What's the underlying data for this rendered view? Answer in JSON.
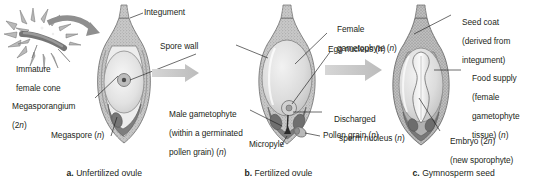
{
  "figure": {
    "background": "#ffffff",
    "ink": "#231f20",
    "arrow_color": "#c9c9c9",
    "tissue_dark": "#8a8a8a",
    "tissue_mid": "#b5b5b5",
    "tissue_light": "#dedede",
    "tissue_pale": "#efefef"
  },
  "panels": [
    {
      "id": "a",
      "caption_letter": "a.",
      "caption_text": "Unfertilized ovule",
      "labels": [
        {
          "name": "immature-female-cone",
          "line1": "Immature",
          "line2": "female cone"
        },
        {
          "name": "megasporangium",
          "line1": "Megasporangium",
          "line2": "(2n)"
        },
        {
          "name": "megaspore",
          "line1": "Megaspore (n)",
          "line2": ""
        },
        {
          "name": "integument",
          "line1": "Integument",
          "line2": ""
        },
        {
          "name": "spore-wall",
          "line1": "Spore wall",
          "line2": ""
        }
      ]
    },
    {
      "id": "b",
      "caption_letter": "b.",
      "caption_text": "Fertilized ovule",
      "labels": [
        {
          "name": "male-gametophyte",
          "line1": "Male gametophyte",
          "line2": "(within a germinated",
          "line3": "pollen grain) (n)"
        },
        {
          "name": "micropyle",
          "line1": "Micropyle",
          "line2": ""
        },
        {
          "name": "female-gametophyte",
          "line1": "Female",
          "line2": "gametophyte (n)"
        },
        {
          "name": "egg-nucleus",
          "line1": "Egg nucleus (n)",
          "line2": ""
        },
        {
          "name": "discharged-sperm-nucleus",
          "line1": "Discharged",
          "line2": "sperm nucleus (n)"
        },
        {
          "name": "pollen-grain",
          "line1": "Pollen grain (n)",
          "line2": ""
        }
      ]
    },
    {
      "id": "c",
      "caption_letter": "c.",
      "caption_text": "Gymnosperm seed",
      "labels": [
        {
          "name": "seed-coat",
          "line1": "Seed coat",
          "line2": "(derived from",
          "line3": "integument)"
        },
        {
          "name": "food-supply",
          "line1": "Food supply",
          "line2": "(female",
          "line3": "gametophyte",
          "line4": "tissue) (n)"
        },
        {
          "name": "embryo",
          "line1": "Embryo (2n)",
          "line2": "(new sporophyte)"
        }
      ]
    }
  ],
  "text": {
    "immature": "Immature",
    "female_cone": "female cone",
    "megasporangium": "Megasporangium",
    "megasporangium_ploidy": "(2n)",
    "megaspore": "Megaspore (n)",
    "integument": "Integument",
    "spore_wall": "Spore wall",
    "male_gametophyte_l1": "Male gametophyte",
    "male_gametophyte_l2": "(within a germinated",
    "male_gametophyte_l3": "pollen grain) (n)",
    "micropyle": "Micropyle",
    "female_l1": "Female",
    "female_l2": "gametophyte (n)",
    "egg_nucleus": "Egg nucleus (n)",
    "discharged_l1": "Discharged",
    "discharged_l2": "sperm nucleus (n)",
    "pollen_grain": "Pollen grain (n)",
    "seed_coat_l1": "Seed coat",
    "seed_coat_l2": "(derived from",
    "seed_coat_l3": "integument)",
    "food_supply_l1": "Food supply",
    "food_supply_l2": "(female",
    "food_supply_l3": "gametophyte",
    "food_supply_l4": "tissue) (n)",
    "embryo_l1": "Embryo (2n)",
    "embryo_l2": "(new sporophyte)",
    "cap_a_letter": "a.",
    "cap_a_text": "Unfertilized ovule",
    "cap_b_letter": "b.",
    "cap_b_text": "Fertilized ovule",
    "cap_c_letter": "c.",
    "cap_c_text": "Gymnosperm seed"
  }
}
